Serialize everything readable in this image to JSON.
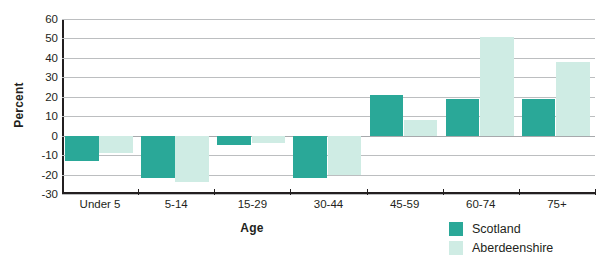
{
  "chart_data": {
    "type": "bar",
    "title": "",
    "subtitle": "",
    "xlabel": "Age",
    "ylabel": "Percent",
    "categories": [
      "Under 5",
      "5-14",
      "15-29",
      "30-44",
      "45-59",
      "60-74",
      "75+"
    ],
    "series": [
      {
        "name": "Scotland",
        "color": "#2aa898",
        "values": [
          -13,
          -22,
          -5,
          -22,
          21,
          19,
          19
        ]
      },
      {
        "name": "Aberdeenshire",
        "color": "#cfece4",
        "values": [
          -9,
          -24,
          -4,
          -20,
          8,
          51,
          38
        ]
      }
    ],
    "ylim": [
      -30,
      60
    ],
    "yticks": [
      60,
      50,
      40,
      30,
      20,
      10,
      0,
      -10,
      -20,
      -30
    ],
    "ytick_labels": [
      "60",
      "50",
      "40",
      "30",
      "20",
      "10",
      "0",
      "-10",
      "-20",
      "-30"
    ],
    "grid": true,
    "legend_position": "bottom-right",
    "annotations": []
  },
  "colors": {
    "scotland": "#2aa898",
    "aberdeenshire": "#cfece4",
    "gridline": "#bcbec0",
    "axis": "#231f20",
    "background": "#ffffff"
  },
  "legend": {
    "items": [
      {
        "label": "Scotland"
      },
      {
        "label": "Aberdeenshire"
      }
    ]
  }
}
